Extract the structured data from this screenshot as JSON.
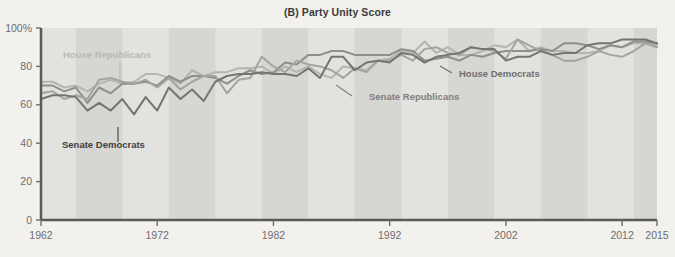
{
  "chart_data": {
    "type": "line",
    "title": "(B) Party Unity Score",
    "xlabel": "",
    "ylabel": "",
    "xlim": [
      1962,
      2015
    ],
    "ylim": [
      0,
      100
    ],
    "grid": false,
    "legend_position": "inline-annotations",
    "x_ticks": [
      "1962",
      "1972",
      "1982",
      "1992",
      "2002",
      "2012",
      "2015"
    ],
    "x_tick_values": [
      1962,
      1972,
      1982,
      1992,
      2002,
      2012,
      2015
    ],
    "y_ticks": [
      "0",
      "20",
      "40",
      "60",
      "80",
      "100%"
    ],
    "y_tick_values": [
      0,
      20,
      40,
      60,
      80,
      100
    ],
    "x": [
      1962,
      1963,
      1964,
      1965,
      1966,
      1967,
      1968,
      1969,
      1970,
      1971,
      1972,
      1973,
      1974,
      1975,
      1976,
      1977,
      1978,
      1979,
      1980,
      1981,
      1982,
      1983,
      1984,
      1985,
      1986,
      1987,
      1988,
      1989,
      1990,
      1991,
      1992,
      1993,
      1994,
      1995,
      1996,
      1997,
      1998,
      1999,
      2000,
      2001,
      2002,
      2003,
      2004,
      2005,
      2006,
      2007,
      2008,
      2009,
      2010,
      2011,
      2012,
      2013,
      2014,
      2015
    ],
    "series": [
      {
        "name": "House Republicans",
        "color": "#b4b4b0",
        "values": [
          72,
          72,
          69,
          70,
          67,
          71,
          73,
          71,
          72,
          76,
          76,
          74,
          71,
          78,
          75,
          77,
          77,
          79,
          79,
          80,
          76,
          80,
          77,
          80,
          76,
          74,
          80,
          79,
          78,
          83,
          84,
          88,
          87,
          93,
          87,
          90,
          86,
          86,
          88,
          91,
          90,
          94,
          88,
          90,
          88,
          88,
          87,
          87,
          88,
          91,
          90,
          92,
          92,
          91
        ]
      },
      {
        "name": "House Democrats",
        "color": "#8e8e8b",
        "values": [
          70,
          70,
          67,
          69,
          61,
          69,
          66,
          71,
          71,
          72,
          70,
          75,
          72,
          75,
          75,
          74,
          71,
          75,
          78,
          76,
          77,
          82,
          81,
          86,
          86,
          88,
          88,
          86,
          86,
          86,
          86,
          89,
          88,
          83,
          84,
          85,
          83,
          86,
          85,
          87,
          88,
          88,
          88,
          89,
          88,
          92,
          92,
          91,
          89,
          91,
          90,
          93,
          93,
          92
        ]
      },
      {
        "name": "Senate Republicans",
        "color": "#a3a3a0",
        "values": [
          66,
          67,
          63,
          65,
          63,
          73,
          74,
          72,
          71,
          73,
          69,
          74,
          68,
          72,
          75,
          75,
          66,
          73,
          74,
          85,
          80,
          77,
          83,
          81,
          80,
          78,
          74,
          79,
          77,
          83,
          83,
          86,
          83,
          89,
          90,
          87,
          86,
          90,
          89,
          88,
          84,
          94,
          91,
          88,
          86,
          83,
          83,
          85,
          88,
          86,
          85,
          88,
          92,
          90
        ]
      },
      {
        "name": "Senate Democrats",
        "color": "#747472",
        "values": [
          63,
          65,
          65,
          64,
          57,
          61,
          57,
          63,
          55,
          64,
          57,
          69,
          63,
          68,
          62,
          72,
          75,
          76,
          76,
          77,
          76,
          76,
          75,
          79,
          74,
          85,
          85,
          78,
          82,
          83,
          82,
          87,
          86,
          82,
          85,
          86,
          87,
          90,
          89,
          89,
          83,
          85,
          85,
          88,
          86,
          87,
          87,
          91,
          92,
          92,
          94,
          94,
          94,
          92
        ]
      }
    ],
    "annotations": [
      {
        "text": "House Republicans",
        "color": "#b9b9b5"
      },
      {
        "text": "House Democrats",
        "color": "#6f6f6d"
      },
      {
        "text": "Senate Republicans",
        "color": "#7f7f7d"
      },
      {
        "text": "Senate Democrats",
        "color": "#3f3f3e"
      }
    ],
    "background_bands": {
      "band_color": "#d6d6d2",
      "base_color": "#e2e2de",
      "note": "Alternating vertical shaded bands"
    }
  }
}
